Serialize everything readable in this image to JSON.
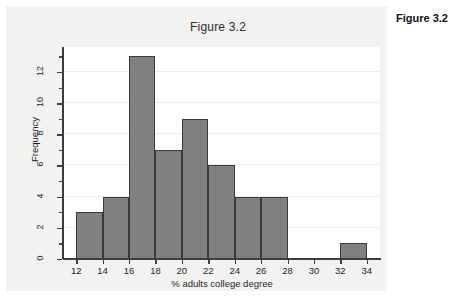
{
  "caption": {
    "text": "Figure 3.2"
  },
  "chart_data": {
    "type": "bar",
    "title": "Figure 3.2",
    "xlabel": "% adults college degree",
    "ylabel": "Frequency",
    "xlim": [
      11,
      35
    ],
    "ylim": [
      0,
      13.6
    ],
    "grid": true,
    "legend": "none",
    "bin_width": 2,
    "x_ticks": [
      12,
      14,
      16,
      18,
      20,
      22,
      24,
      26,
      28,
      30,
      32,
      34
    ],
    "x_tick_labels": [
      "12",
      "14",
      "16",
      "18",
      "20",
      "22",
      "24",
      "26",
      "28",
      "30",
      "32",
      "34"
    ],
    "y_ticks": [
      0,
      2,
      4,
      6,
      8,
      10,
      12
    ],
    "y_tick_labels": [
      "0",
      "2",
      "4",
      "6",
      "8",
      "10",
      "12"
    ],
    "y_minor_ticks": [
      1,
      3,
      5,
      7,
      9,
      11,
      13
    ],
    "bins": [
      {
        "start": 12,
        "end": 14,
        "value": 3
      },
      {
        "start": 14,
        "end": 16,
        "value": 4
      },
      {
        "start": 16,
        "end": 18,
        "value": 13
      },
      {
        "start": 18,
        "end": 20,
        "value": 7
      },
      {
        "start": 20,
        "end": 22,
        "value": 9
      },
      {
        "start": 22,
        "end": 24,
        "value": 6
      },
      {
        "start": 24,
        "end": 26,
        "value": 4
      },
      {
        "start": 26,
        "end": 28,
        "value": 4
      },
      {
        "start": 28,
        "end": 30,
        "value": 0
      },
      {
        "start": 30,
        "end": 32,
        "value": 0
      },
      {
        "start": 32,
        "end": 34,
        "value": 1
      }
    ],
    "categories": [
      "12-14",
      "14-16",
      "16-18",
      "18-20",
      "20-22",
      "22-24",
      "24-26",
      "26-28",
      "28-30",
      "30-32",
      "32-34"
    ],
    "values": [
      3,
      4,
      13,
      7,
      9,
      6,
      4,
      4,
      0,
      0,
      1
    ],
    "colors": {
      "bar_fill": "#808080",
      "bar_edge": "#3a3a3a",
      "plot_background": "#ffffff",
      "figure_background": "#f2f2f1",
      "gridline": "#ececec",
      "axis": "#3d3d3d",
      "text": "#1f1f1f"
    }
  }
}
